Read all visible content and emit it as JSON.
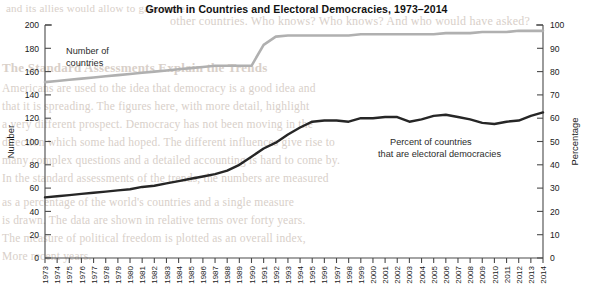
{
  "chart_data": {
    "type": "line",
    "title": "Growth in Countries and Electoral Democracies, 1973–2014",
    "xlabel": "",
    "ylabel": "Number",
    "y2label": "Percentage",
    "ylim": [
      0,
      200
    ],
    "y2lim": [
      0,
      100
    ],
    "grid": false,
    "legend_position": "inline-annotations",
    "x": [
      1973,
      1974,
      1975,
      1976,
      1977,
      1978,
      1979,
      1980,
      1981,
      1982,
      1983,
      1984,
      1985,
      1986,
      1987,
      1988,
      1989,
      1990,
      1991,
      1992,
      1993,
      1994,
      1995,
      1996,
      1997,
      1998,
      1999,
      2000,
      2001,
      2002,
      2003,
      2004,
      2005,
      2006,
      2007,
      2008,
      2009,
      2010,
      2011,
      2012,
      2013,
      2014
    ],
    "xtick_labels": [
      "1973",
      "1974",
      "1975",
      "1976",
      "1977",
      "1978",
      "1979",
      "1980",
      "1981",
      "1982",
      "1983",
      "1984",
      "1985",
      "1986",
      "1987",
      "1988",
      "1989",
      "1990",
      "1991",
      "1992",
      "1993",
      "1994",
      "1995",
      "1996",
      "1997",
      "1998",
      "1999",
      "2000",
      "2001",
      "2002",
      "2003",
      "2004",
      "2005",
      "2006",
      "2007",
      "2008",
      "2009",
      "2010",
      "2011",
      "2012",
      "2013",
      "2014"
    ],
    "ytick_labels": [
      "0",
      "20",
      "40",
      "60",
      "80",
      "100",
      "120",
      "140",
      "160",
      "180",
      "200"
    ],
    "ytick_values": [
      0,
      20,
      40,
      60,
      80,
      100,
      120,
      140,
      160,
      180,
      200
    ],
    "y2tick_labels": [
      "0",
      "10",
      "20",
      "30",
      "40",
      "50",
      "60",
      "70",
      "80",
      "90",
      "100"
    ],
    "y2tick_values": [
      0,
      10,
      20,
      30,
      40,
      50,
      60,
      70,
      80,
      90,
      100
    ],
    "series": [
      {
        "name": "Number of countries",
        "axis": "left",
        "color": "#b0b0b0",
        "annotation": [
          "Number of",
          "countries"
        ],
        "values": [
          151,
          152,
          153,
          154,
          155,
          156,
          157,
          158,
          159,
          160,
          161,
          162,
          163,
          164,
          165,
          165,
          165,
          165,
          183,
          190,
          191,
          191,
          191,
          191,
          191,
          191,
          192,
          192,
          192,
          192,
          192,
          192,
          192,
          193,
          193,
          193,
          194,
          194,
          194,
          195,
          195,
          195
        ]
      },
      {
        "name": "Percent of countries that are electoral democracies",
        "axis": "left",
        "color": "#262626",
        "annotation": [
          "Percent of countries",
          "that are electoral democracies"
        ],
        "values": [
          52,
          53,
          54,
          55,
          56,
          57,
          58,
          59,
          61,
          62,
          64,
          66,
          68,
          70,
          72,
          75,
          80,
          87,
          94,
          99,
          106,
          112,
          117,
          118,
          118,
          117,
          120,
          120,
          121,
          121,
          117,
          119,
          122,
          123,
          121,
          119,
          116,
          115,
          117,
          118,
          122,
          125
        ]
      }
    ]
  },
  "annotations": {
    "countries_label_line1": "Number of",
    "countries_label_line2": "countries",
    "democracies_label_line1": "Percent of countries",
    "democracies_label_line2": "that are electoral democracies"
  },
  "bleed_text": {
    "l1": "and its allies would allow to gain some",
    "l2": "other countries. Who knows? Who knows? And who would have asked?",
    "l3": "The Standard Assessments Explain the Trends",
    "l4": "Americans are used to the idea that democracy is a good idea and",
    "l5": "that it is spreading. The figures here, with more detail, highlight",
    "l6": "a very different prospect. Democracy has not been moving in the",
    "l7": "direction which some had hoped. The different influences give rise to",
    "l8": "many complex questions and a detailed accounting is hard to come by.",
    "l9": "In the standard assessments of the trends, the numbers are measured",
    "l10": "as a percentage of the world's countries and a single measure",
    "l11": "is drawn. The data are shown in relative terms over forty years.",
    "l12": "The measure of political freedom is plotted as an overall index,",
    "l13": "More recent years."
  }
}
